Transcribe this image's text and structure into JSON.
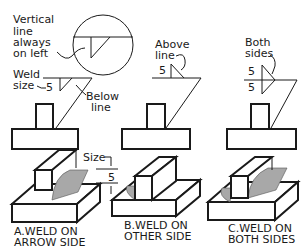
{
  "figure": {
    "callouts": {
      "vertical_line": [
        "Vertical",
        "line",
        "always",
        "on  left"
      ],
      "weld_size": [
        "Weld",
        "size"
      ],
      "below_line": [
        "Below",
        "line"
      ],
      "above_line": [
        "Above",
        "line"
      ],
      "both_sides": [
        "Both",
        "sides"
      ],
      "size": "Size"
    },
    "symbols": {
      "a_size": "5",
      "b_size": "5",
      "c_size_top": "5",
      "c_size_bottom": "5",
      "dim_size": "5"
    },
    "captions": {
      "a": [
        "A.WELD  ON",
        "ARROW  SIDE"
      ],
      "b": [
        "B.WELD  ON",
        "OTHER  SIDE"
      ],
      "c": [
        "C.WELD  ON",
        "BOTH  SIDES"
      ]
    }
  }
}
